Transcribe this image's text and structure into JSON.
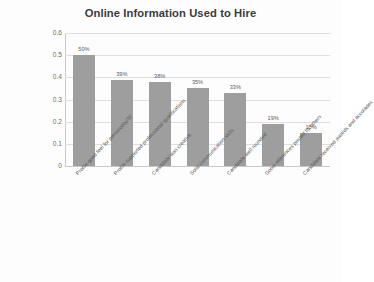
{
  "chart_data": {
    "type": "bar",
    "title": "Online Information Used to Hire",
    "xlabel": "",
    "ylabel": "",
    "ylim": [
      0,
      0.6
    ],
    "ytick_labels": [
      "0.6",
      "0.5",
      "0.4",
      "0.3",
      "0.2",
      "0.1",
      "0"
    ],
    "ytick_values": [
      0.6,
      0.5,
      0.4,
      0.3,
      0.2,
      0.1,
      0
    ],
    "grid": true,
    "legend": false,
    "bar_color": "#9e9e9e",
    "categories": [
      "Profile good feel for personality/'fit'",
      "Profile supported professional  qualifications",
      "Candidate was creative",
      "Solid communication skills",
      "Candidate well rounded",
      "Good references posted by others",
      "Candidate received awards and accolades"
    ],
    "values": [
      0.5,
      0.39,
      0.38,
      0.35,
      0.33,
      0.19,
      0.15
    ],
    "data_labels": [
      "50%",
      "39%",
      "38%",
      "35%",
      "33%",
      "19%",
      "15%"
    ]
  }
}
